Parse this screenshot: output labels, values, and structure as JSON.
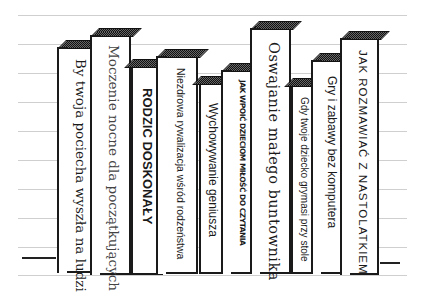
{
  "shelf": {
    "books": [
      {
        "title": "By twoja pociecha wyszła na ludzi"
      },
      {
        "title": "Moczenie nocne dla początkujących"
      },
      {
        "title": "RODZIC DOSKONAŁY"
      },
      {
        "title": "Niezdrowa rywalizacja wśród rodzeństwa"
      },
      {
        "title": "Wychowywanie geniusza"
      },
      {
        "title": "JAK WPOIĆ DZIECIOM MIŁOŚĆ DO CZYTANIA"
      },
      {
        "title": "Oswajanie małego buntownika"
      },
      {
        "title": "Gdy twoje dziecko grymasi przy stole"
      },
      {
        "title": "Gry i zabawy bez komputera"
      },
      {
        "title": "JAK ROZMAWIAĆ Z NASTOLATKIEM"
      }
    ]
  }
}
